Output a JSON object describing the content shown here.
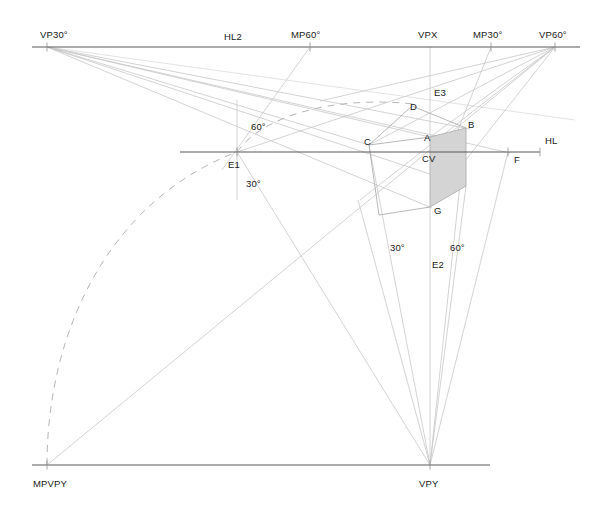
{
  "canvas": {
    "width": 606,
    "height": 518,
    "background": "#ffffff"
  },
  "colors": {
    "horizon_line": "#595959",
    "construction_line": "#c8c8c8",
    "faint_line": "#dcdcdc",
    "cube_edge": "#b0b0b0",
    "cube_shade_fill": "#d4d4d4",
    "dashed_arc": "#b5b5b5",
    "tick": "#9a9a9a",
    "label_text": "#1a1a1a"
  },
  "points": {
    "VP30": {
      "x": 47,
      "y": 47,
      "label": "VP30°"
    },
    "HL2": {
      "x": 244,
      "y": 47,
      "label": "HL2"
    },
    "MP60": {
      "x": 310,
      "y": 47,
      "label": "MP60°"
    },
    "VPX": {
      "x": 430,
      "y": 47,
      "label": "VPX"
    },
    "MP30": {
      "x": 491,
      "y": 47,
      "label": "MP30°"
    },
    "VP60": {
      "x": 555,
      "y": 47,
      "label": "VP60°"
    },
    "E1": {
      "x": 237,
      "y": 152,
      "label": "E1"
    },
    "E2": {
      "x": 437,
      "y": 262,
      "label": "E2"
    },
    "E3": {
      "x": 430,
      "y": 92,
      "label": "E3"
    },
    "F": {
      "x": 508,
      "y": 152,
      "label": "F"
    },
    "HL": {
      "x": 556,
      "y": 152,
      "label": "HL"
    },
    "CV": {
      "x": 430,
      "y": 152,
      "label": "CV"
    },
    "A": {
      "x": 430,
      "y": 137,
      "label": "A"
    },
    "B": {
      "x": 466,
      "y": 128,
      "label": "B"
    },
    "C": {
      "x": 369,
      "y": 145,
      "label": "C"
    },
    "D": {
      "x": 412,
      "y": 106,
      "label": "D"
    },
    "G": {
      "x": 430,
      "y": 207,
      "label": "G"
    },
    "VPY": {
      "x": 430,
      "y": 465,
      "label": "VPY"
    },
    "MPVPY": {
      "x": 47,
      "y": 465,
      "label": "MPVPY"
    }
  },
  "angle_labels": [
    {
      "name": "angle-60-upper-left",
      "text": "60°",
      "x": 251,
      "y": 122
    },
    {
      "name": "angle-30-lower-left",
      "text": "30°",
      "x": 246,
      "y": 179
    },
    {
      "name": "angle-30-lower-mid",
      "text": "30°",
      "x": 390,
      "y": 243
    },
    {
      "name": "angle-60-lower-right",
      "text": "60°",
      "x": 450,
      "y": 243
    }
  ],
  "point_labels": [
    {
      "name": "label-vp30",
      "text": "VP30°",
      "x": 40,
      "y": 30
    },
    {
      "name": "label-hl2",
      "text": "HL2",
      "x": 224,
      "y": 32
    },
    {
      "name": "label-mp60",
      "text": "MP60°",
      "x": 291,
      "y": 30
    },
    {
      "name": "label-vpx",
      "text": "VPX",
      "x": 418,
      "y": 30
    },
    {
      "name": "label-mp30",
      "text": "MP30°",
      "x": 473,
      "y": 30
    },
    {
      "name": "label-vp60",
      "text": "VP60°",
      "x": 539,
      "y": 30
    },
    {
      "name": "label-e3",
      "text": "E3",
      "x": 434,
      "y": 88
    },
    {
      "name": "label-d",
      "text": "D",
      "x": 410,
      "y": 102
    },
    {
      "name": "label-b",
      "text": "B",
      "x": 468,
      "y": 120
    },
    {
      "name": "label-c",
      "text": "C",
      "x": 364,
      "y": 137
    },
    {
      "name": "label-a",
      "text": "A",
      "x": 424,
      "y": 133
    },
    {
      "name": "label-hl",
      "text": "HL",
      "x": 545,
      "y": 136
    },
    {
      "name": "label-cv",
      "text": "CV",
      "x": 422,
      "y": 154
    },
    {
      "name": "label-f",
      "text": "F",
      "x": 514,
      "y": 155
    },
    {
      "name": "label-e1",
      "text": "E1",
      "x": 228,
      "y": 160
    },
    {
      "name": "label-g",
      "text": "G",
      "x": 434,
      "y": 206
    },
    {
      "name": "label-e2",
      "text": "E2",
      "x": 432,
      "y": 260
    },
    {
      "name": "label-mpvpy",
      "text": "MPVPY",
      "x": 33,
      "y": 479
    },
    {
      "name": "label-vpy",
      "text": "VPY",
      "x": 419,
      "y": 479
    }
  ],
  "major_lines": [
    {
      "name": "horizon-line-hl2",
      "x1": 32,
      "y1": 47,
      "x2": 580,
      "y2": 47,
      "width": 1.1
    },
    {
      "name": "horizon-line-hl",
      "x1": 180,
      "y1": 152,
      "x2": 540,
      "y2": 152,
      "width": 1.1
    },
    {
      "name": "ground-line-vpy",
      "x1": 32,
      "y1": 465,
      "x2": 490,
      "y2": 465,
      "width": 1.1
    }
  ],
  "tick_marks": [
    {
      "name": "tick-vp30",
      "x": 47,
      "y": 47,
      "len": 9
    },
    {
      "name": "tick-mp60",
      "x": 310,
      "y": 47,
      "len": 9
    },
    {
      "name": "tick-mp30",
      "x": 491,
      "y": 47,
      "len": 9
    },
    {
      "name": "tick-vp60",
      "x": 555,
      "y": 47,
      "len": 9
    },
    {
      "name": "tick-e1",
      "x": 237,
      "y": 152,
      "len": 9
    },
    {
      "name": "tick-f",
      "x": 508,
      "y": 152,
      "len": 9
    },
    {
      "name": "tick-hl-right",
      "x": 540,
      "y": 152,
      "len": 9
    },
    {
      "name": "tick-mpvpy",
      "x": 47,
      "y": 465,
      "len": 9
    },
    {
      "name": "tick-vpy",
      "x": 430,
      "y": 465,
      "len": 9
    }
  ],
  "construction_lines": [
    {
      "name": "ray-vp30-to-c",
      "x1": 47,
      "y1": 47,
      "x2": 369,
      "y2": 145
    },
    {
      "name": "ray-vp30-to-a",
      "x1": 47,
      "y1": 47,
      "x2": 430,
      "y2": 137
    },
    {
      "name": "ray-vp30-to-b",
      "x1": 47,
      "y1": 47,
      "x2": 470,
      "y2": 129
    },
    {
      "name": "ray-vp30-to-g",
      "x1": 47,
      "y1": 47,
      "x2": 432,
      "y2": 208
    },
    {
      "name": "ray-vp30-to-lower",
      "x1": 47,
      "y1": 47,
      "x2": 466,
      "y2": 186
    },
    {
      "name": "ray-vp30-to-f",
      "x1": 47,
      "y1": 47,
      "x2": 510,
      "y2": 153
    },
    {
      "name": "ray-vp60-to-a",
      "x1": 555,
      "y1": 47,
      "x2": 430,
      "y2": 137
    },
    {
      "name": "ray-vp60-to-c",
      "x1": 555,
      "y1": 47,
      "x2": 369,
      "y2": 145
    },
    {
      "name": "ray-vp60-to-d",
      "x1": 555,
      "y1": 47,
      "x2": 320,
      "y2": 101
    },
    {
      "name": "ray-vp60-to-g",
      "x1": 555,
      "y1": 47,
      "x2": 428,
      "y2": 208
    },
    {
      "name": "ray-vp60-to-e1",
      "x1": 555,
      "y1": 47,
      "x2": 237,
      "y2": 152
    },
    {
      "name": "ray-vp60-to-lowleft",
      "x1": 555,
      "y1": 47,
      "x2": 360,
      "y2": 200
    },
    {
      "name": "ray-mp60-down-left",
      "x1": 310,
      "y1": 47,
      "x2": 222,
      "y2": 170
    },
    {
      "name": "ray-mp30-to-cube",
      "x1": 491,
      "y1": 47,
      "x2": 430,
      "y2": 200
    },
    {
      "name": "vertical-vpx",
      "x1": 430,
      "y1": 47,
      "x2": 430,
      "y2": 137
    },
    {
      "name": "vertical-e1-axis",
      "x1": 237,
      "y1": 100,
      "x2": 237,
      "y2": 200
    },
    {
      "name": "line-mpvpy-to-vp60",
      "x1": 47,
      "y1": 465,
      "x2": 555,
      "y2": 47
    },
    {
      "name": "line-e1-to-vpy",
      "x1": 237,
      "y1": 152,
      "x2": 430,
      "y2": 465
    },
    {
      "name": "line-c-to-vpy",
      "x1": 369,
      "y1": 145,
      "x2": 430,
      "y2": 465
    },
    {
      "name": "line-cg-to-vpy",
      "x1": 358,
      "y1": 200,
      "x2": 430,
      "y2": 465
    },
    {
      "name": "line-b-to-vpy",
      "x1": 466,
      "y1": 128,
      "x2": 430,
      "y2": 465
    },
    {
      "name": "line-bf-to-vpy",
      "x1": 466,
      "y1": 186,
      "x2": 430,
      "y2": 465
    },
    {
      "name": "line-g-to-vpy",
      "x1": 430,
      "y1": 207,
      "x2": 430,
      "y2": 465
    },
    {
      "name": "line-f-to-vpy",
      "x1": 508,
      "y1": 152,
      "x2": 430,
      "y2": 465
    },
    {
      "name": "line-vp30-long-faint",
      "x1": 47,
      "y1": 47,
      "x2": 575,
      "y2": 120
    }
  ],
  "cube": {
    "name": "perspective-cube",
    "edges": [
      {
        "name": "edge-c-a",
        "x1": 369,
        "y1": 145,
        "x2": 430,
        "y2": 137
      },
      {
        "name": "edge-a-b",
        "x1": 430,
        "y1": 137,
        "x2": 466,
        "y2": 128
      },
      {
        "name": "edge-c-d",
        "x1": 369,
        "y1": 145,
        "x2": 412,
        "y2": 106
      },
      {
        "name": "edge-d-b",
        "x1": 412,
        "y1": 106,
        "x2": 466,
        "y2": 128
      },
      {
        "name": "edge-a-g",
        "x1": 430,
        "y1": 137,
        "x2": 430,
        "y2": 207
      },
      {
        "name": "edge-c-down",
        "x1": 369,
        "y1": 145,
        "x2": 379,
        "y2": 215
      },
      {
        "name": "edge-b-down",
        "x1": 466,
        "y1": 128,
        "x2": 466,
        "y2": 186
      },
      {
        "name": "edge-g-left",
        "x1": 430,
        "y1": 207,
        "x2": 379,
        "y2": 215
      },
      {
        "name": "edge-g-right",
        "x1": 430,
        "y1": 207,
        "x2": 466,
        "y2": 186
      }
    ],
    "shaded_face": {
      "name": "cube-shaded-face",
      "points": "430,137 466,128 466,186 430,207"
    }
  },
  "dashed_paths": [
    {
      "name": "arc-mpvpy-to-e1",
      "d": "M 47 465 C 47 330, 110 200, 237 152"
    },
    {
      "name": "arc-e1-to-d",
      "d": "M 237 152 C 260 118, 330 95, 414 104"
    }
  ]
}
